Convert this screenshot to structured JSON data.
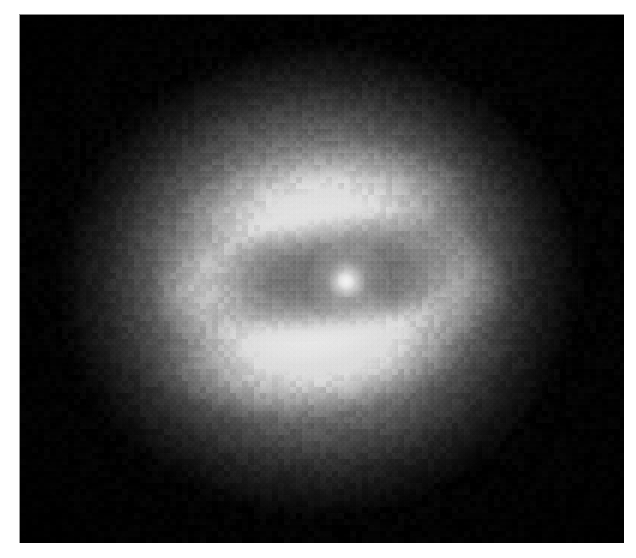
{
  "page": {
    "background_color": "#ffffff",
    "width": 636,
    "height": 558,
    "caption": ""
  },
  "figure": {
    "kind": "astronomical-image",
    "frame": {
      "left": 19,
      "top": 14,
      "width": 605,
      "height": 529,
      "background_color": "#000000",
      "border_color": "#8a8a8a"
    },
    "palette": {
      "sky_background": "#030303",
      "outer_halo": "#4a4a4a",
      "mid_halo": "#8c8c8c",
      "inner_halo": "#bfbfbf",
      "bright_rim": "#ececec",
      "brightest_rim": "#fafafa",
      "dust_lane": "#3a3a3a",
      "nucleus": "#ffffff"
    },
    "features": [
      {
        "name": "outer-diffuse-halo",
        "description": "broad faint elliptical glow fading into black sky",
        "center_x": 298,
        "center_y": 264,
        "semi_major": 270,
        "semi_minor": 246,
        "rotation_deg": -6,
        "peak_gray": 150
      },
      {
        "name": "mid-halo",
        "description": "brighter elliptical envelope surrounding the dust ring",
        "center_x": 300,
        "center_y": 262,
        "semi_major": 220,
        "semi_minor": 196,
        "rotation_deg": -6,
        "peak_gray": 196
      },
      {
        "name": "inner-halo",
        "description": "bright inner envelope immediately outside the dust torus",
        "center_x": 300,
        "center_y": 260,
        "semi_major": 172,
        "semi_minor": 150,
        "rotation_deg": -6,
        "peak_gray": 226
      },
      {
        "name": "bright-lower-rim",
        "description": "brightest arc of the disk, below the dust lane",
        "center_x": 295,
        "center_y": 340,
        "semi_major": 165,
        "semi_minor": 64,
        "rotation_deg": -7,
        "peak_gray": 250
      },
      {
        "name": "bright-upper-rim",
        "description": "fainter bright arc above the dust lane",
        "center_x": 308,
        "center_y": 183,
        "semi_major": 158,
        "semi_minor": 55,
        "rotation_deg": -7,
        "peak_gray": 232
      },
      {
        "name": "left-ring-knot",
        "description": "bright knot on the left edge of the ring",
        "center_x": 188,
        "center_y": 276,
        "peak_gray": 228
      },
      {
        "name": "right-ring-knot",
        "description": "bright knot on the right edge of the ring",
        "center_x": 426,
        "center_y": 269,
        "peak_gray": 222
      },
      {
        "name": "dust-torus",
        "description": "dark tilted elliptical absorption ring encircling the nucleus",
        "center_x": 313,
        "center_y": 260,
        "semi_major": 145,
        "semi_minor": 66,
        "rotation_deg": -9,
        "peak_gray": 58
      },
      {
        "name": "nucleus",
        "description": "unresolved bright point source at the galaxy center",
        "center_x": 326,
        "center_y": 266,
        "radius": 8,
        "peak_gray": 255
      }
    ],
    "texture": {
      "type": "pixelated-ccd-noise",
      "block_size_px": 6,
      "strength": 0.35
    }
  }
}
